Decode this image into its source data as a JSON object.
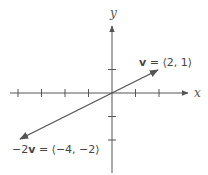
{
  "diagram": {
    "axes": {
      "x_label": "x",
      "y_label": "y",
      "origin_px": [
        112,
        93
      ],
      "unit_px": 23.5,
      "x_ticks": [
        -4,
        -3,
        -2,
        -1,
        1,
        2
      ],
      "y_ticks": [
        1,
        -1,
        -2
      ],
      "color": "#555555"
    },
    "vectors": [
      {
        "name": "v",
        "components": [
          2,
          1
        ],
        "label_prefix": "",
        "label_bold": "v",
        "label_rest": " = ⟨2, 1⟩",
        "color": "#555555"
      },
      {
        "name": "-2v",
        "components": [
          -4,
          -2
        ],
        "label_prefix": "−2",
        "label_bold": "v",
        "label_rest": " = ⟨−4, −2⟩",
        "color": "#555555"
      }
    ]
  }
}
